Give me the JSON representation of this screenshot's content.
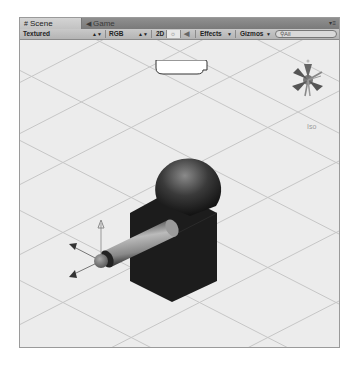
{
  "tabs": [
    {
      "label": "Scene",
      "icon": "grid-icon",
      "active": true
    },
    {
      "label": "Game",
      "icon": "pacman-icon",
      "active": false
    }
  ],
  "toolbar": {
    "render_mode": "Textured",
    "color_mode": "RGB",
    "mode_2d": "2D",
    "lighting_icon": "sun-icon",
    "audio_icon": "speaker-icon",
    "effects": "Effects",
    "gizmos": "Gizmos",
    "search_placeholder": "All"
  },
  "scene_gizmo": {
    "projection_label": "Iso"
  },
  "colors": {
    "panel_bg": "#ececec",
    "grid_line": "#c8c8c8",
    "tabbar": "#858585",
    "toolbar": "#bebebe",
    "cube": "#1e1e1e",
    "callout": "#ffffff"
  }
}
